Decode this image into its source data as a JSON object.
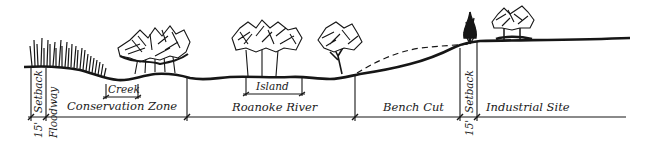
{
  "diagram": {
    "type": "cross-section",
    "zones": [
      {
        "label": "Floodway",
        "x_start": 31,
        "x_end": 47
      },
      {
        "label": "Conservation Zone",
        "x_start": 47,
        "x_end": 187
      },
      {
        "label": "Roanoke River",
        "x_start": 187,
        "x_end": 355
      },
      {
        "label": "Bench Cut",
        "x_start": 355,
        "x_end": 460
      },
      {
        "label": "Industrial Site",
        "x_start": 478,
        "x_end": 625
      }
    ],
    "labels": {
      "setback_left": "Setback",
      "setback_left_dim": "15'",
      "floodway": "Floodway",
      "creek": "Creek",
      "conservation_zone": "Conservation Zone",
      "island": "Island",
      "roanoke_river": "Roanoke River",
      "bench_cut": "Bench Cut",
      "setback_right": "Setback",
      "setback_right_dim": "15'",
      "industrial_site": "Industrial Site"
    },
    "colors": {
      "ink": "#161616",
      "background": "#ffffff"
    }
  }
}
